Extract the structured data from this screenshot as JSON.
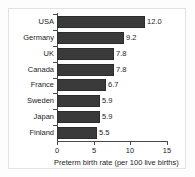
{
  "chart_data": {
    "type": "bar",
    "orientation": "horizontal",
    "title": "",
    "xlabel": "Preterm birth rate (per 100 live births)",
    "ylabel": "",
    "categories": [
      "USA",
      "Germany",
      "UK",
      "Canada",
      "France",
      "Sweden",
      "Japan",
      "Finland"
    ],
    "values": [
      12.0,
      9.2,
      7.8,
      7.8,
      6.7,
      5.9,
      5.9,
      5.5
    ],
    "data_labels": [
      "12.0",
      "9.2",
      "7.8",
      "7.8",
      "6.7",
      "5.9",
      "5.9",
      "5.5"
    ],
    "xlim": [
      0,
      15
    ],
    "x_ticks": [
      0,
      5,
      10,
      15
    ],
    "x_tick_labels": [
      "0",
      "5",
      "10",
      "15"
    ],
    "grid": false,
    "legend": null,
    "bar_color": "#3a3a3a",
    "bar_edge_color": "#2c2c2c",
    "axis_color": "#4a4a4a",
    "text_color": "#1d1d1d",
    "background_color": "#ffffff",
    "frame_color": "#e2e2e2"
  }
}
